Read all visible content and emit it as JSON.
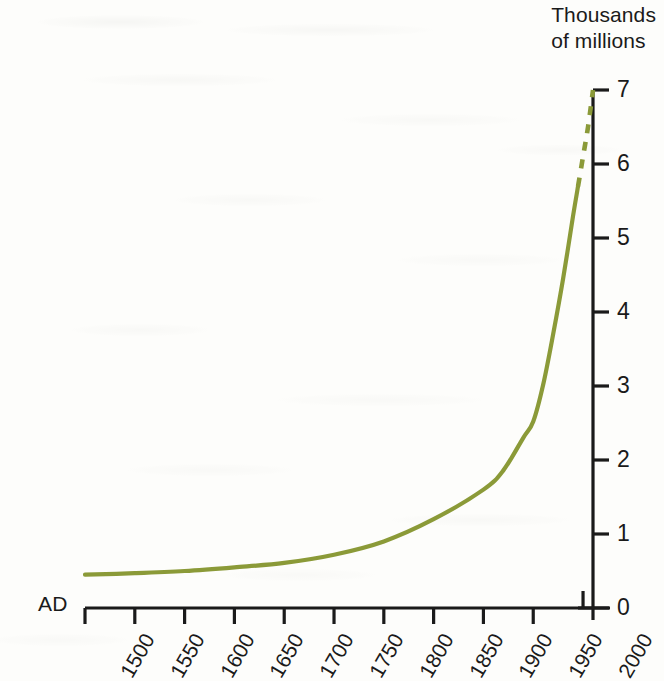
{
  "chart_data": {
    "type": "line",
    "title": "",
    "axis_title": "Thousands of millions",
    "axis_title_line1": "Thousands",
    "axis_title_line2": "of millions",
    "xlabel_prefix": "AD",
    "ylabel": "Thousands of millions",
    "xlim": [
      1500,
      2010
    ],
    "ylim": [
      0,
      7
    ],
    "grid": false,
    "legend": null,
    "x_ticks": [
      "1500",
      "1550",
      "1600",
      "1650",
      "1700",
      "1750",
      "1800",
      "1850",
      "1900",
      "1950",
      "2000"
    ],
    "x_tick_values": [
      1500,
      1550,
      1600,
      1650,
      1700,
      1750,
      1800,
      1850,
      1900,
      1950,
      2000
    ],
    "y_ticks": [
      "0",
      "1",
      "2",
      "3",
      "4",
      "5",
      "6",
      "7"
    ],
    "y_tick_values": [
      0,
      1,
      2,
      3,
      4,
      5,
      6,
      7
    ],
    "series": [
      {
        "name": "World population",
        "style": "solid",
        "color": "#8b9a38",
        "x": [
          1500,
          1550,
          1600,
          1650,
          1700,
          1750,
          1800,
          1850,
          1900,
          1920,
          1940,
          1950,
          1960,
          1970,
          1980,
          1990,
          1995
        ],
        "values": [
          0.45,
          0.47,
          0.5,
          0.55,
          0.61,
          0.72,
          0.9,
          1.2,
          1.6,
          1.86,
          2.3,
          2.52,
          3.02,
          3.7,
          4.45,
          5.3,
          5.7
        ]
      },
      {
        "name": "Projection",
        "style": "dashed",
        "color": "#8b9a38",
        "x": [
          1995,
          2000,
          2005,
          2010
        ],
        "values": [
          5.7,
          6.1,
          6.5,
          7.0
        ]
      }
    ],
    "annotations": [
      {
        "text": "curve becomes dashed above about 5 thousand million, indicating projected values"
      }
    ]
  },
  "geometry": {
    "axis_color": "#1a1a1a",
    "plot_left": 85,
    "plot_right": 593,
    "plot_top": 90,
    "plot_bottom": 608
  }
}
